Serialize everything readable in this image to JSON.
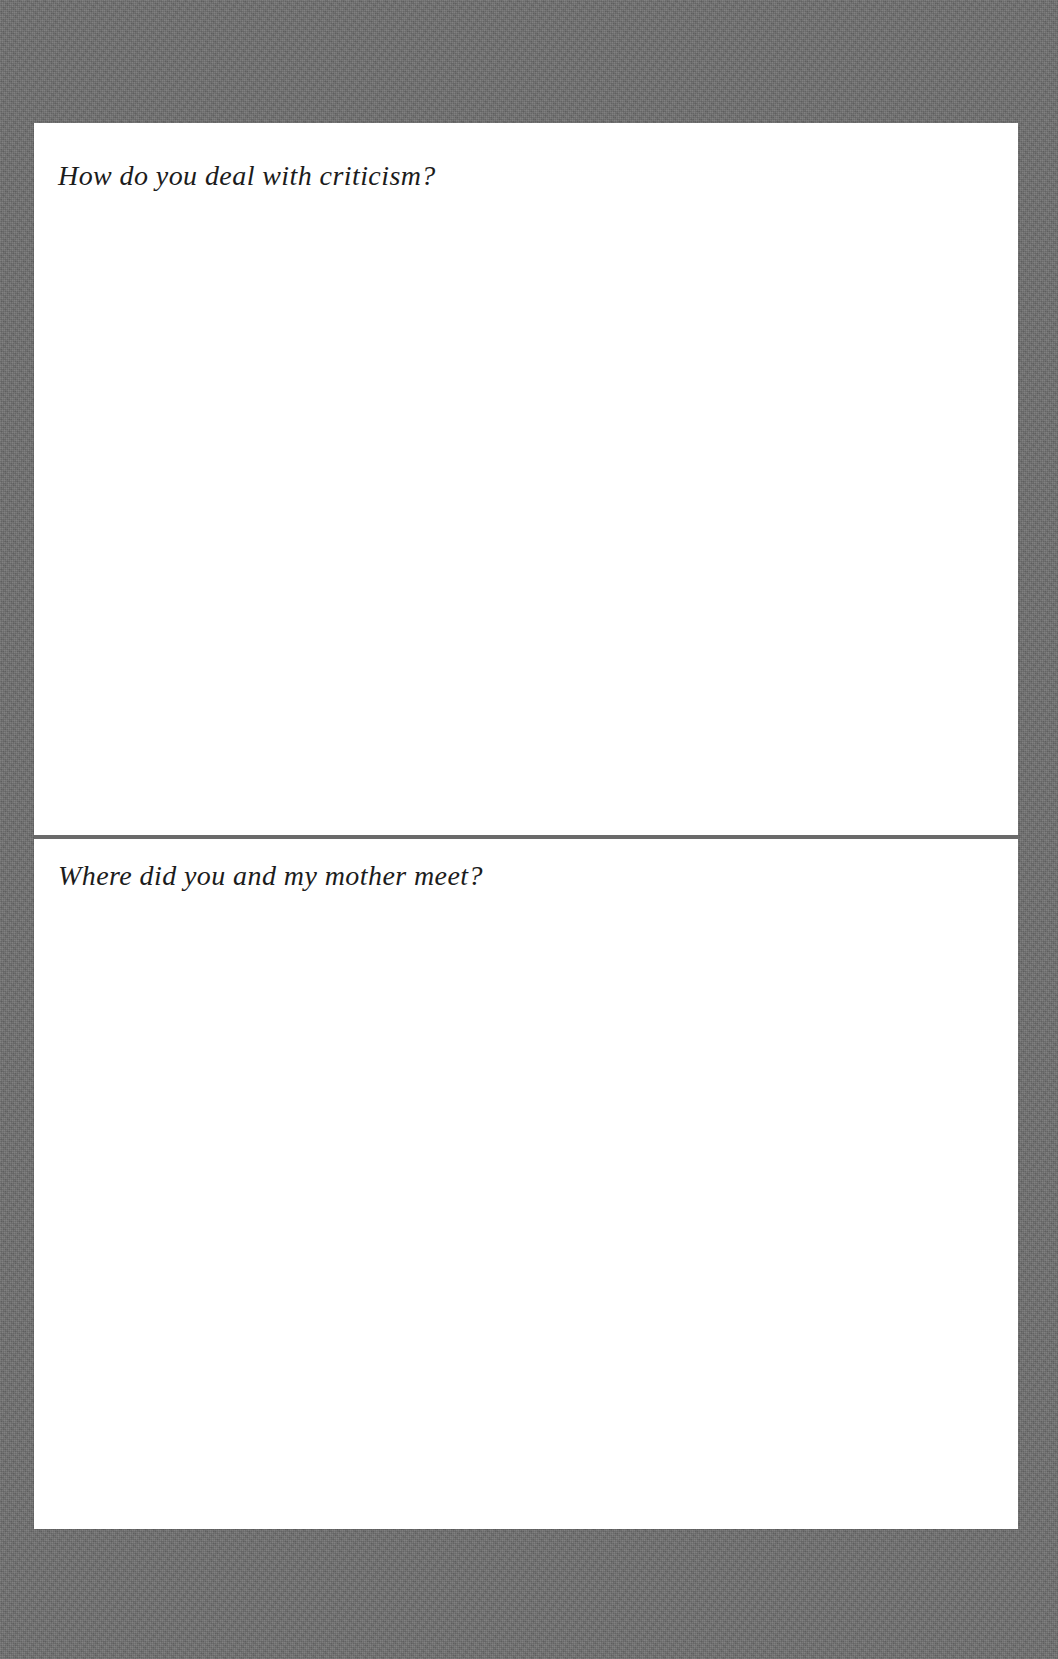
{
  "document": {
    "type": "journal-page",
    "background_color": "#6e6e6e",
    "page_color": "#ffffff",
    "divider_color": "#6a6a6a",
    "text_color": "#1c1c1c"
  },
  "prompts": [
    {
      "id": "prompt-criticism",
      "question": "How do you deal with criticism?",
      "answer": ""
    },
    {
      "id": "prompt-mother-meet",
      "question": "Where did you and my mother meet?",
      "answer": ""
    }
  ]
}
